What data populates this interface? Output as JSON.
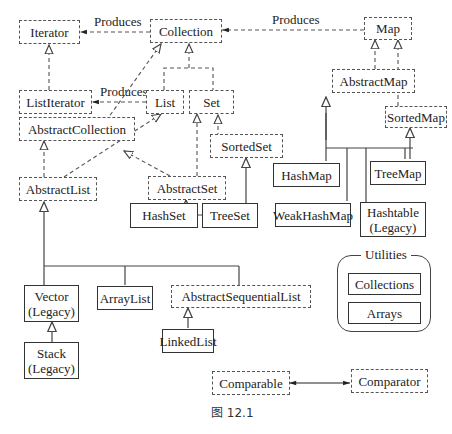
{
  "diagram": {
    "caption": "图 12.1",
    "relation_labels": {
      "collection_produces_iterator": "Produces",
      "list_produces_listiterator": "Produces",
      "map_produces_collection": "Produces"
    },
    "nodes": {
      "iterator": {
        "label": "Iterator",
        "kind": "interface"
      },
      "collection": {
        "label": "Collection",
        "kind": "interface"
      },
      "map": {
        "label": "Map",
        "kind": "interface"
      },
      "list_iterator": {
        "label": "ListIterator",
        "kind": "interface"
      },
      "list": {
        "label": "List",
        "kind": "interface"
      },
      "set": {
        "label": "Set",
        "kind": "interface"
      },
      "abstract_map": {
        "label": "AbstractMap",
        "kind": "abstract"
      },
      "sorted_map": {
        "label": "SortedMap",
        "kind": "interface"
      },
      "abstract_collection": {
        "label": "AbstractCollection",
        "kind": "abstract"
      },
      "sorted_set": {
        "label": "SortedSet",
        "kind": "interface"
      },
      "abstract_list": {
        "label": "AbstractList",
        "kind": "abstract"
      },
      "abstract_set": {
        "label": "AbstractSet",
        "kind": "abstract"
      },
      "hash_map": {
        "label": "HashMap",
        "kind": "class"
      },
      "tree_map": {
        "label": "TreeMap",
        "kind": "class"
      },
      "weak_hash_map": {
        "label": "WeakHashMap",
        "kind": "class"
      },
      "hashtable": {
        "label": "Hashtable",
        "sub": "(Legacy)",
        "kind": "class"
      },
      "hash_set": {
        "label": "HashSet",
        "kind": "class"
      },
      "tree_set": {
        "label": "TreeSet",
        "kind": "class"
      },
      "vector": {
        "label": "Vector",
        "sub": "(Legacy)",
        "kind": "class"
      },
      "array_list": {
        "label": "ArrayList",
        "kind": "class"
      },
      "abstract_sequential_list": {
        "label": "AbstractSequentialList",
        "kind": "abstract"
      },
      "linked_list": {
        "label": "LinkedList",
        "kind": "class"
      },
      "stack": {
        "label": "Stack",
        "sub": "(Legacy)",
        "kind": "class"
      },
      "comparable": {
        "label": "Comparable",
        "kind": "interface"
      },
      "comparator": {
        "label": "Comparator",
        "kind": "interface"
      }
    },
    "utilities": {
      "title": "Utilities",
      "items": [
        "Collections",
        "Arrays"
      ]
    }
  }
}
